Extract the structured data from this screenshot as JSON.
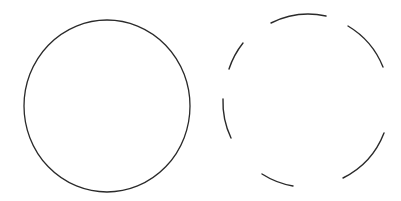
{
  "figure": {
    "background": "#ffffff",
    "stroke_color": "#2a2a2a",
    "shapes": [
      {
        "name": "solid-circle",
        "style": "solid",
        "cx": 107,
        "cy": 106,
        "rx": 83,
        "ry": 86,
        "stroke_width": 1.3
      },
      {
        "name": "dashed-circle",
        "style": "dashed",
        "cx": 304,
        "cy": 101,
        "r": 84,
        "stroke_width": 1.4,
        "segments": [
          {
            "from": [
              271,
              23
            ],
            "to": [
              326,
              16
            ]
          },
          {
            "from": [
              348,
              26
            ],
            "to": [
              383,
              67
            ]
          },
          {
            "from": [
              384,
              133
            ],
            "to": [
              343,
              178
            ]
          },
          {
            "from": [
              293,
              186
            ],
            "to": [
              262,
              174
            ]
          },
          {
            "from": [
              231,
              138
            ],
            "to": [
              223,
              99
            ]
          },
          {
            "from": [
              229,
              69
            ],
            "to": [
              243,
              43
            ]
          }
        ]
      }
    ]
  }
}
